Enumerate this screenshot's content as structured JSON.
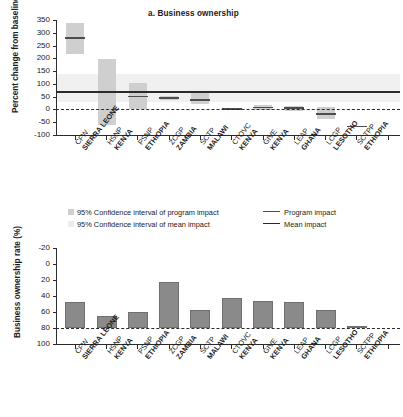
{
  "chart_data": [
    {
      "type": "bar",
      "panel": "a",
      "title": "a. Business ownership",
      "ylabel": "Percent change from baseline",
      "xlabel": "",
      "ylim": [
        -100,
        350
      ],
      "yticks": [
        -100,
        -50,
        0,
        50,
        100,
        150,
        200,
        250,
        300,
        350
      ],
      "ytick_labels": [
        "-100",
        "-50",
        "0",
        "50",
        "100",
        "150",
        "200",
        "250",
        "300",
        "350"
      ],
      "grid": false,
      "legend_position": "below-axis",
      "zero_reference_line": 0,
      "mean_impact": 68,
      "mean_impact_ci": [
        30,
        140
      ],
      "categories": [
        "CFW SIERRA LEONE",
        "HSNP KENYA",
        "PSNP ETHIOPIA",
        "ZCGP ZAMBIA",
        "SCTP MALAWI",
        "CTOVC KENYA",
        "GIVE KENYA",
        "LEAP GHANA",
        "LCGP LESOTHO",
        "SCTPP ETHIOPIA"
      ],
      "category_programs": [
        "CFW",
        "HSNP",
        "PSNP",
        "ZCGP",
        "SCTP",
        "CTOVC",
        "GIVE",
        "LEAP",
        "LCGP",
        "SCTPP"
      ],
      "category_countries": [
        "SIERRA LEONE",
        "KENYA",
        "ETHIOPIA",
        "ZAMBIA",
        "MALAWI",
        "KENYA",
        "KENYA",
        "GHANA",
        "LESOTHO",
        "ETHIOPIA"
      ],
      "series": [
        {
          "name": "Program impact",
          "values": [
            279,
            67,
            51,
            44,
            37,
            2,
            7,
            5,
            -18,
            -67
          ]
        },
        {
          "name": "95% Confidence interval of program impact",
          "ci_low": [
            217,
            -62,
            0,
            36,
            21,
            -2,
            -4,
            -8,
            -38,
            -67
          ],
          "ci_high": [
            340,
            198,
            105,
            54,
            68,
            5,
            16,
            15,
            8,
            -67
          ]
        }
      ]
    },
    {
      "type": "bar",
      "panel": "b",
      "title": "",
      "ylabel": "Business ownership rate (%)",
      "xlabel": "",
      "ylim": [
        -20,
        100
      ],
      "yticks": [
        -20,
        0,
        20,
        40,
        60,
        80,
        100
      ],
      "ytick_labels": [
        "-20",
        "0",
        "20",
        "40",
        "60",
        "80",
        "100"
      ],
      "grid": false,
      "zero_reference_line": 0,
      "categories": [
        "CFW SIERRA LEONE",
        "HSNP KENYA",
        "PSNP ETHIOPIA",
        "ZCGP ZAMBIA",
        "SCTP MALAWI",
        "CTOVC KENYA",
        "GIVE KENYA",
        "LEAP GHANA",
        "LCGP LESOTHO",
        "SCTPP ETHIOPIA"
      ],
      "category_programs": [
        "CFW",
        "HSNP",
        "PSNP",
        "ZCGP",
        "SCTP",
        "CTOVC",
        "GIVE",
        "LEAP",
        "LCGP",
        "SCTPP"
      ],
      "category_countries": [
        "SIERRA LEONE",
        "KENYA",
        "ETHIOPIA",
        "ZAMBIA",
        "MALAWI",
        "KENYA",
        "KENYA",
        "GHANA",
        "LESOTHO",
        "ETHIOPIA"
      ],
      "values": [
        33,
        15.5,
        20,
        57,
        23,
        37,
        34,
        32,
        22,
        2
      ]
    }
  ],
  "panel_a": {
    "title": "a. Business ownership",
    "ylabel_line1": "Percent change from",
    "ylabel_line2": "baseline",
    "ytick_labels": [
      "350",
      "300",
      "250",
      "200",
      "150",
      "100",
      "50",
      "0",
      "-50",
      "-100"
    ]
  },
  "panel_b": {
    "ylabel_line1": "Business ownership",
    "ylabel_line2": "rate (%)",
    "ytick_labels": [
      "100",
      "80",
      "60",
      "40",
      "20",
      "0",
      "-20"
    ]
  },
  "xlabels": [
    {
      "program": "CFW",
      "country": "SIERRA LEONE"
    },
    {
      "program": "HSNP",
      "country": "KENYA"
    },
    {
      "program": "PSNP",
      "country": "ETHIOPIA"
    },
    {
      "program": "ZCGP",
      "country": "ZAMBIA"
    },
    {
      "program": "SCTP",
      "country": "MALAWI"
    },
    {
      "program": "CTOVC",
      "country": "KENYA"
    },
    {
      "program": "GIVE",
      "country": "KENYA"
    },
    {
      "program": "LEAP",
      "country": "GHANA"
    },
    {
      "program": "LCGP",
      "country": "LESOTHO"
    },
    {
      "program": "SCTPP",
      "country": "ETHIOPIA"
    }
  ],
  "legend": {
    "ci_program": "95% Confidence interval of program impact",
    "program_impact": "Program impact",
    "ci_mean": "95% Confidence interval of mean impact",
    "mean_impact": "Mean impact"
  },
  "colors": {
    "ci_box": "#cfcfcf",
    "mean_band": "#f0f0f0",
    "impact_line": "#4d4d4d",
    "mean_line": "#2b2b2b",
    "bar": "#8a8a8a",
    "axis": "#2b2b2b"
  }
}
